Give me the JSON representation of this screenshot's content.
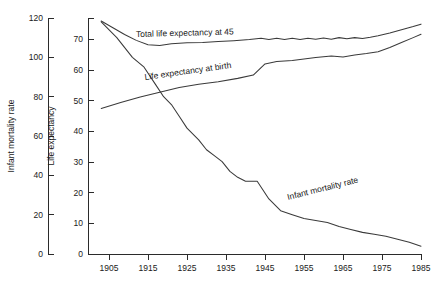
{
  "chart_data": {
    "type": "line",
    "title": "",
    "subtitle": "",
    "xlabel": "",
    "ylabel": "Infant mortality rate",
    "ylabel2": "Life expectancy",
    "grid": false,
    "legend": "inline-annotations",
    "x": [
      1905,
      1915,
      1925,
      1935,
      1945,
      1955,
      1965,
      1975,
      1985
    ],
    "xlim": [
      1901,
      1985
    ],
    "axes": [
      {
        "name": "Infant mortality rate",
        "position": "left-outer",
        "lim": [
          0,
          120
        ],
        "ticks": [
          0,
          20,
          40,
          60,
          80,
          100,
          120
        ],
        "tick_labels": [
          "0",
          "20",
          "40",
          "60",
          "80",
          "100",
          "120"
        ]
      },
      {
        "name": "Life expectancy",
        "position": "left-inner",
        "lim": [
          0,
          77
        ],
        "ticks": [
          0,
          10,
          20,
          30,
          40,
          50,
          60,
          70
        ],
        "tick_labels": [
          "0",
          "10",
          "20",
          "30",
          "40",
          "50",
          "60",
          "70"
        ]
      }
    ],
    "xticks": [
      1905,
      1915,
      1925,
      1935,
      1945,
      1955,
      1965,
      1975,
      1985
    ],
    "xtick_labels": [
      "1905",
      "1915",
      "1925",
      "1935",
      "1945",
      "1955",
      "1965",
      "1975",
      "1985"
    ],
    "series": [
      {
        "name": "Total life expectancy at 45",
        "label": "Total life expectancy at 45",
        "axis": "life-expectancy",
        "color": "#3a3a3a",
        "points": [
          [
            1903,
            76.0
          ],
          [
            1906,
            73.8
          ],
          [
            1909,
            71.6
          ],
          [
            1912,
            69.7
          ],
          [
            1915,
            68.3
          ],
          [
            1918,
            68.0
          ],
          [
            1921,
            68.6
          ],
          [
            1925,
            68.9
          ],
          [
            1929,
            69.0
          ],
          [
            1933,
            69.3
          ],
          [
            1937,
            69.6
          ],
          [
            1941,
            70.0
          ],
          [
            1944,
            70.4
          ],
          [
            1946,
            70.0
          ],
          [
            1948,
            70.4
          ],
          [
            1950,
            70.0
          ],
          [
            1952,
            70.4
          ],
          [
            1954,
            70.0
          ],
          [
            1956,
            70.4
          ],
          [
            1958,
            70.1
          ],
          [
            1960,
            70.5
          ],
          [
            1962,
            70.1
          ],
          [
            1964,
            70.6
          ],
          [
            1966,
            70.2
          ],
          [
            1968,
            70.6
          ],
          [
            1970,
            70.3
          ],
          [
            1972,
            70.7
          ],
          [
            1974,
            71.2
          ],
          [
            1977,
            72.1
          ],
          [
            1980,
            73.2
          ],
          [
            1983,
            74.2
          ],
          [
            1985,
            75.0
          ]
        ]
      },
      {
        "name": "Life expectancy at birth",
        "label": "Life expectancy  at birth",
        "axis": "life-expectancy",
        "color": "#3a3a3a",
        "points": [
          [
            1903,
            47.5
          ],
          [
            1908,
            49.4
          ],
          [
            1913,
            51.2
          ],
          [
            1918,
            52.8
          ],
          [
            1923,
            54.3
          ],
          [
            1928,
            55.4
          ],
          [
            1933,
            56.2
          ],
          [
            1938,
            57.3
          ],
          [
            1942,
            58.4
          ],
          [
            1945,
            62.0
          ],
          [
            1948,
            62.8
          ],
          [
            1952,
            63.1
          ],
          [
            1955,
            63.6
          ],
          [
            1958,
            64.1
          ],
          [
            1962,
            64.6
          ],
          [
            1965,
            64.3
          ],
          [
            1968,
            64.9
          ],
          [
            1971,
            65.4
          ],
          [
            1974,
            66.0
          ],
          [
            1977,
            67.4
          ],
          [
            1980,
            69.0
          ],
          [
            1983,
            70.6
          ],
          [
            1985,
            71.7
          ]
        ]
      },
      {
        "name": "Infant mortality rate",
        "label": "Infant mortality rate",
        "axis": "infant-mortality",
        "color": "#3a3a3a",
        "points": [
          [
            1903,
            118.0
          ],
          [
            1907,
            110.0
          ],
          [
            1911,
            100.0
          ],
          [
            1914,
            95.0
          ],
          [
            1917,
            86.0
          ],
          [
            1919,
            80.0
          ],
          [
            1921,
            76.0
          ],
          [
            1923,
            70.0
          ],
          [
            1925,
            64.0
          ],
          [
            1928,
            58.0
          ],
          [
            1930,
            53.0
          ],
          [
            1932,
            50.0
          ],
          [
            1934,
            47.0
          ],
          [
            1936,
            42.0
          ],
          [
            1938,
            39.0
          ],
          [
            1940,
            37.0
          ],
          [
            1943,
            37.0
          ],
          [
            1946,
            28.0
          ],
          [
            1949,
            22.0
          ],
          [
            1952,
            20.0
          ],
          [
            1955,
            18.0
          ],
          [
            1958,
            17.0
          ],
          [
            1961,
            16.0
          ],
          [
            1964,
            14.0
          ],
          [
            1967,
            12.5
          ],
          [
            1970,
            11.0
          ],
          [
            1973,
            10.0
          ],
          [
            1976,
            9.0
          ],
          [
            1979,
            7.5
          ],
          [
            1982,
            6.0
          ],
          [
            1985,
            4.0
          ]
        ]
      }
    ],
    "annotations": [
      {
        "name": "total-life-expectancy-at-45-label",
        "text": "Total life expectancy at 45",
        "x": 136,
        "y": 37,
        "rotate": -1.5
      },
      {
        "name": "life-expectancy-at-birth-label",
        "text": "Life expectancy  at birth",
        "x": 145,
        "y": 80,
        "rotate": -8
      },
      {
        "name": "infant-mortality-rate-label",
        "text": "Infant mortality rate",
        "x": 288,
        "y": 200,
        "rotate": -14
      }
    ]
  }
}
